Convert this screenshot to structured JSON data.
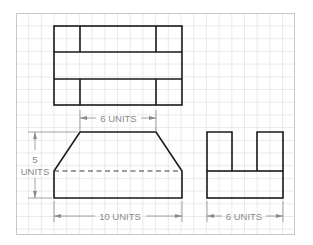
{
  "views": {
    "top": {
      "label": "Top view"
    },
    "front": {
      "label": "Front view"
    },
    "side": {
      "label": "Side view"
    }
  },
  "dimensions": {
    "front_top_width": {
      "value": "6",
      "unit": "UNITS",
      "text": "6 UNITS"
    },
    "front_height": {
      "value": "5",
      "unit": "UNITS",
      "line1": "5",
      "line2": "UNITS"
    },
    "front_bottom_width": {
      "value": "10",
      "unit": "UNITS",
      "text": "10 UNITS"
    },
    "side_width": {
      "value": "6",
      "unit": "UNITS",
      "text": "6 UNITS"
    }
  },
  "grid": {
    "spacing_px": 12.7,
    "color": "#dcdcdc"
  },
  "colors": {
    "outline": "#1a1a1a",
    "dimension": "#8a8a8a",
    "frame": "#c8c8c8"
  }
}
